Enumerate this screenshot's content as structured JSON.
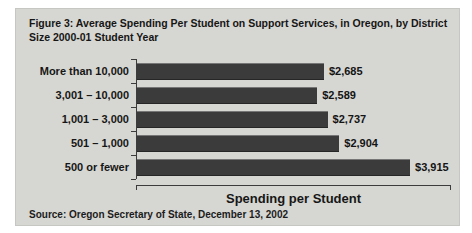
{
  "figure": {
    "background_color": "#d6d6d2",
    "source": "Source: Oregon Secretary of State, December 13, 2002"
  },
  "chart_data": {
    "type": "bar",
    "orientation": "horizontal",
    "title": "Figure 3: Average Spending Per Student on Support Services, in Oregon, by District Size 2000-01 Student Year",
    "categories": [
      "More than 10,000",
      "3,001 – 10,000",
      "1,001 – 3,000",
      "501 – 1,000",
      "500 or fewer"
    ],
    "values": [
      2685,
      2589,
      2737,
      2904,
      3915
    ],
    "value_labels": [
      "$2,685",
      "$2,589",
      "$2,737",
      "$2,904",
      "$3,915"
    ],
    "xlabel": "Spending per Student",
    "ylabel": "",
    "xlim": [
      0,
      4500
    ],
    "grid": false,
    "legend": false,
    "bar_color": "#3b3b3b",
    "axis_color": "#3c3c3c"
  }
}
